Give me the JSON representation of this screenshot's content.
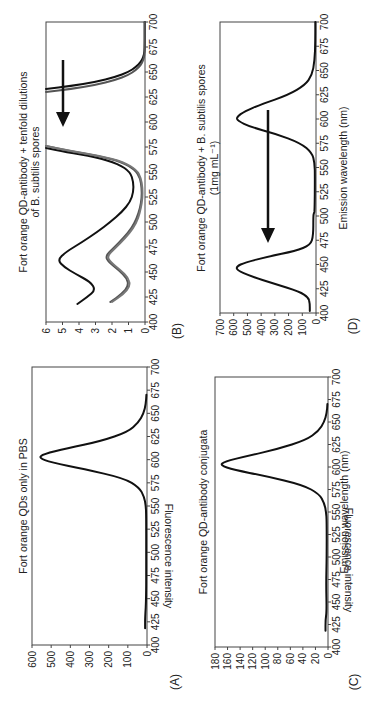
{
  "figure": {
    "orientation": "rotated-90-clockwise",
    "xlabel": "Emission wavelength (nm)",
    "ylabel": "Fluorescence intensity"
  },
  "chart_data": [
    {
      "panel": "(A)",
      "type": "line",
      "title": "Fort orange QDs only in PBS",
      "xlabel": "",
      "ylabel": "Fluorescence intensity",
      "xlim": [
        400,
        700
      ],
      "ylim": [
        0,
        600
      ],
      "xticks": [
        400,
        425,
        450,
        475,
        500,
        525,
        550,
        575,
        600,
        625,
        650,
        675,
        700
      ],
      "yticks": [
        0,
        100,
        200,
        300,
        400,
        500,
        600
      ],
      "series": [
        {
          "name": "QDs in PBS",
          "color": "#111111",
          "x": [
            418,
            430,
            450,
            500,
            540,
            550,
            560,
            570,
            580,
            590,
            597,
            602,
            606,
            612,
            620,
            630,
            640,
            650,
            660,
            670
          ],
          "y": [
            10,
            10,
            4,
            4,
            4,
            6,
            15,
            40,
            120,
            330,
            500,
            565,
            540,
            420,
            240,
            100,
            45,
            18,
            6,
            3
          ]
        }
      ]
    },
    {
      "panel": "(B)",
      "type": "line",
      "title": "Fort orange QD-antibody + tenfold dilutions of B. subtilis spores",
      "xlabel": "",
      "ylabel": "",
      "xlim": [
        400,
        700
      ],
      "ylim": [
        0,
        6
      ],
      "xticks": [
        400,
        425,
        450,
        475,
        500,
        525,
        550,
        575,
        600,
        625,
        650,
        675,
        700
      ],
      "yticks": [
        0,
        1,
        2,
        3,
        4,
        5,
        6
      ],
      "annotation": "arrow pointing down toward 460 nm peak",
      "series": [
        {
          "name": "highest spore conc.",
          "color": "#111111",
          "x": [
            418,
            425,
            432,
            440,
            448,
            455,
            462,
            470,
            480,
            490,
            500,
            510,
            520,
            530,
            540,
            550,
            558,
            565,
            570,
            574
          ],
          "y": [
            4.1,
            3.5,
            3.0,
            3.3,
            4.2,
            4.9,
            5.3,
            4.8,
            3.8,
            2.9,
            2.1,
            1.4,
            0.9,
            0.7,
            0.7,
            0.9,
            1.6,
            3.0,
            4.8,
            6.0
          ]
        },
        {
          "name": "dilution 1",
          "color": "#555555",
          "x": [
            420,
            428,
            436,
            444,
            452,
            460,
            466,
            474,
            484,
            494,
            504,
            514,
            524,
            534,
            544,
            552,
            560,
            566,
            571,
            576
          ],
          "y": [
            2.1,
            1.4,
            1.0,
            1.1,
            1.6,
            2.2,
            2.4,
            1.9,
            1.3,
            0.8,
            0.5,
            0.3,
            0.2,
            0.2,
            0.3,
            0.6,
            1.4,
            2.8,
            4.6,
            6.0
          ]
        },
        {
          "name": "dilution 2",
          "color": "#777777",
          "x": [
            420,
            428,
            436,
            444,
            452,
            460,
            466,
            474,
            484,
            494,
            504,
            514,
            524,
            534,
            544,
            552,
            560,
            566,
            571,
            576
          ],
          "y": [
            2.0,
            1.3,
            0.9,
            1.0,
            1.5,
            2.1,
            2.3,
            1.8,
            1.2,
            0.7,
            0.4,
            0.25,
            0.15,
            0.15,
            0.25,
            0.5,
            1.3,
            2.7,
            4.5,
            6.0
          ]
        },
        {
          "name": "highest spore conc. (tail)",
          "color": "#111111",
          "x": [
            633,
            636,
            640,
            645,
            650,
            655,
            660,
            665,
            670,
            680,
            690,
            700
          ],
          "y": [
            6.0,
            4.5,
            3.0,
            1.8,
            1.0,
            0.55,
            0.25,
            0.1,
            0.03,
            0.02,
            0.02,
            0.02
          ]
        },
        {
          "name": "dilution (tail)",
          "color": "#555555",
          "x": [
            630,
            633,
            637,
            642,
            647,
            652,
            657,
            662,
            667,
            675,
            690,
            700
          ],
          "y": [
            6.0,
            4.5,
            3.0,
            1.8,
            1.0,
            0.55,
            0.25,
            0.1,
            0.03,
            0.02,
            0.02,
            0.02
          ]
        }
      ]
    },
    {
      "panel": "(C)",
      "type": "line",
      "title": "Fort orange QD-antibody conjugata",
      "xlabel": "Emission wavelength (nm)",
      "ylabel": "Fluorescence intensity",
      "xlim": [
        400,
        700
      ],
      "ylim": [
        0,
        180
      ],
      "xticks": [
        400,
        425,
        450,
        475,
        500,
        525,
        550,
        575,
        600,
        625,
        650,
        675,
        700
      ],
      "yticks": [
        0,
        20,
        40,
        60,
        80,
        100,
        120,
        140,
        160,
        180
      ],
      "series": [
        {
          "name": "QD-antibody conjugate",
          "color": "#111111",
          "x": [
            418,
            430,
            440,
            470,
            500,
            540,
            550,
            560,
            570,
            580,
            590,
            597,
            602,
            606,
            612,
            620,
            630,
            640,
            650,
            660,
            670
          ],
          "y": [
            4,
            4,
            2,
            3,
            2,
            2,
            3,
            6,
            14,
            40,
            100,
            150,
            172,
            165,
            130,
            80,
            35,
            15,
            6,
            2,
            1
          ]
        }
      ]
    },
    {
      "panel": "(D)",
      "type": "line",
      "title": "Fort orange QD-antibody + B. subtilis spores",
      "subtitle": "(1mg mL⁻¹)",
      "xlabel": "Emission wavelength (nm)",
      "ylabel": "",
      "xlim": [
        400,
        700
      ],
      "ylim": [
        0,
        700
      ],
      "xticks": [
        400,
        425,
        450,
        475,
        500,
        525,
        550,
        575,
        600,
        625,
        650,
        675,
        700
      ],
      "yticks": [
        0,
        100,
        200,
        300,
        400,
        500,
        600,
        700
      ],
      "annotation": "arrow from 590 nm toward 470 nm",
      "series": [
        {
          "name": "QD-antibody + spores",
          "color": "#111111",
          "x": [
            402,
            410,
            416,
            422,
            430,
            438,
            444,
            448,
            452,
            458,
            464,
            470,
            480,
            500,
            503,
            505,
            540,
            555,
            565,
            575,
            585,
            592,
            598,
            602,
            608,
            615,
            625,
            635,
            645,
            660,
            680,
            700
          ],
          "y": [
            45,
            45,
            55,
            120,
            300,
            480,
            575,
            580,
            520,
            350,
            150,
            40,
            20,
            20,
            15,
            10,
            8,
            10,
            30,
            110,
            300,
            480,
            570,
            580,
            520,
            400,
            200,
            80,
            30,
            10,
            5,
            5
          ]
        }
      ]
    }
  ],
  "panels": {
    "A": {
      "letter": "(A)",
      "title": "Fort orange QDs only in PBS",
      "ylabel": "Fluorescence intensity"
    },
    "B": {
      "letter": "(B)",
      "title_line1": "Fort orange QD-antibody + tenfold dilutions",
      "title_line2": "of B. subtilis spores"
    },
    "C": {
      "letter": "(C)",
      "title": "Fort orange QD-antibody conjugata",
      "ylabel": "Fluorescence intensity",
      "xlabel": "Emission wavelength (nm)"
    },
    "D": {
      "letter": "(D)",
      "title_line1": "Fort orange QD-antibody + B. subtilis spores",
      "title_line2": "(1mg mL⁻¹)",
      "xlabel": "Emission wavelength (nm)"
    }
  }
}
